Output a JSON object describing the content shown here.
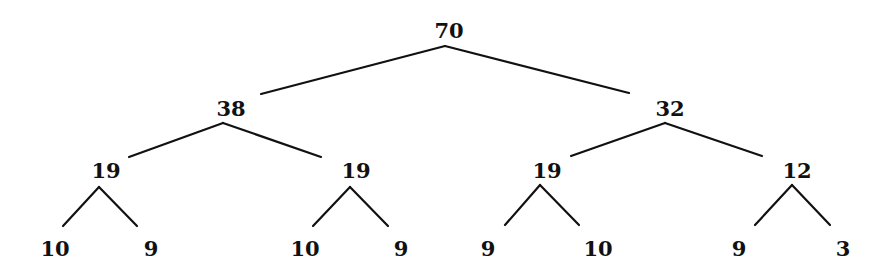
{
  "diagram": {
    "type": "binary-tree",
    "nodes": [
      {
        "id": "root",
        "value": "70",
        "x": 449,
        "y": 30
      },
      {
        "id": "l",
        "value": "38",
        "x": 231,
        "y": 108
      },
      {
        "id": "r",
        "value": "32",
        "x": 670,
        "y": 108
      },
      {
        "id": "ll",
        "value": "19",
        "x": 106,
        "y": 170
      },
      {
        "id": "lr",
        "value": "19",
        "x": 356,
        "y": 170
      },
      {
        "id": "rl",
        "value": "19",
        "x": 547,
        "y": 170
      },
      {
        "id": "rr",
        "value": "12",
        "x": 797,
        "y": 170
      },
      {
        "id": "lll",
        "value": "10",
        "x": 55,
        "y": 248
      },
      {
        "id": "llr",
        "value": "9",
        "x": 151,
        "y": 248
      },
      {
        "id": "lrl",
        "value": "10",
        "x": 305,
        "y": 248
      },
      {
        "id": "lrr",
        "value": "9",
        "x": 401,
        "y": 248
      },
      {
        "id": "rll",
        "value": "9",
        "x": 488,
        "y": 248
      },
      {
        "id": "rlr",
        "value": "10",
        "x": 598,
        "y": 248
      },
      {
        "id": "rrl",
        "value": "9",
        "x": 739,
        "y": 248
      },
      {
        "id": "rrr",
        "value": "3",
        "x": 843,
        "y": 248
      }
    ],
    "edges": [
      {
        "from": "root",
        "to": "l",
        "x1": 445,
        "y1": 46,
        "x2": 261,
        "y2": 94
      },
      {
        "from": "root",
        "to": "r",
        "x1": 445,
        "y1": 46,
        "x2": 629,
        "y2": 93
      },
      {
        "from": "l",
        "to": "ll",
        "x1": 223,
        "y1": 123,
        "x2": 129,
        "y2": 157
      },
      {
        "from": "l",
        "to": "lr",
        "x1": 223,
        "y1": 123,
        "x2": 321,
        "y2": 157
      },
      {
        "from": "r",
        "to": "rl",
        "x1": 665,
        "y1": 123,
        "x2": 571,
        "y2": 156
      },
      {
        "from": "r",
        "to": "rr",
        "x1": 665,
        "y1": 123,
        "x2": 762,
        "y2": 156
      },
      {
        "from": "ll",
        "to": "lll",
        "x1": 99,
        "y1": 187,
        "x2": 63,
        "y2": 226
      },
      {
        "from": "ll",
        "to": "llr",
        "x1": 99,
        "y1": 187,
        "x2": 137,
        "y2": 226
      },
      {
        "from": "lr",
        "to": "lrl",
        "x1": 350,
        "y1": 187,
        "x2": 313,
        "y2": 226
      },
      {
        "from": "lr",
        "to": "lrr",
        "x1": 350,
        "y1": 187,
        "x2": 388,
        "y2": 226
      },
      {
        "from": "rl",
        "to": "rll",
        "x1": 540,
        "y1": 185,
        "x2": 505,
        "y2": 225
      },
      {
        "from": "rl",
        "to": "rlr",
        "x1": 540,
        "y1": 185,
        "x2": 579,
        "y2": 225
      },
      {
        "from": "rr",
        "to": "rrl",
        "x1": 792,
        "y1": 185,
        "x2": 755,
        "y2": 225
      },
      {
        "from": "rr",
        "to": "rrr",
        "x1": 792,
        "y1": 185,
        "x2": 830,
        "y2": 225
      }
    ],
    "colors": {
      "line": "#111111",
      "text": "#111111",
      "background": "#ffffff"
    }
  }
}
